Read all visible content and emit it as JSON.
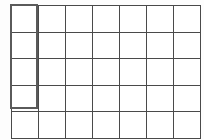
{
  "canvas": {
    "width": 204,
    "height": 140,
    "background_color": "#fdfdfd"
  },
  "grid": {
    "name": "worksheet-grid",
    "columns": 7,
    "rows": 5,
    "origin_x": 11,
    "origin_y": 5,
    "cell_width": 26,
    "cell_height": 25.6,
    "line_color": "#4a4a4a",
    "line_width": 1,
    "cell_fill": "#ffffff",
    "cells": [
      [
        "",
        "",
        "",
        "",
        "",
        "",
        ""
      ],
      [
        "",
        "",
        "",
        "",
        "",
        "",
        ""
      ],
      [
        "",
        "",
        "",
        "",
        "",
        "",
        ""
      ],
      [
        "",
        "",
        "",
        "",
        "",
        "",
        ""
      ],
      [
        "",
        "",
        "",
        "",
        "",
        "",
        ""
      ]
    ]
  },
  "selection": {
    "name": "highlighted-column-region",
    "start_column": 1,
    "end_column": 1,
    "start_row": 1,
    "end_row": 4,
    "x": 10,
    "y": 4,
    "width": 28,
    "height": 105,
    "border_color": "#5a5a5a",
    "border_width": 2
  }
}
